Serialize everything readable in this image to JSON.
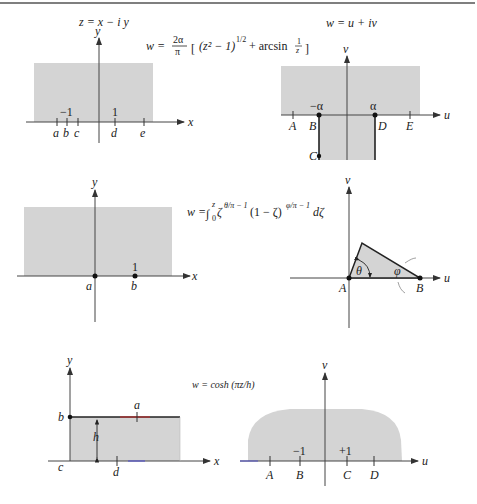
{
  "top_rule": true,
  "panel1": {
    "title": "z = x − i y",
    "axis_y": "y",
    "axis_x": "x",
    "tick_values": {
      "neg_one": "−1",
      "one": "1"
    },
    "points": [
      "a",
      "b",
      "c",
      "d",
      "e"
    ]
  },
  "mapping1": {
    "lhs": "w =",
    "coef_num": "2α",
    "coef_den": "π",
    "body": "(z² − 1)",
    "exponent": "1/2",
    "plus": "+ arcsin",
    "frac_num": "1",
    "frac_den": "z"
  },
  "panel2": {
    "title": "w = u + iv",
    "axis_v": "v",
    "axis_u": "u",
    "tick_values": {
      "neg_alpha": "−α",
      "alpha": "α"
    },
    "points": [
      "A",
      "B",
      "C",
      "D",
      "E"
    ]
  },
  "panel3": {
    "axis_y": "y",
    "axis_x": "x",
    "tick_values": {
      "one": "1"
    },
    "points": [
      "a",
      "b"
    ]
  },
  "mapping2": {
    "lhs": "w =",
    "integral": "∫",
    "upper": "z",
    "lower": "0",
    "zeta1": "ζ",
    "exp1": "θ/π − 1",
    "mid": "(1 − ζ)",
    "exp2": "φ/π − 1",
    "tail": "dζ"
  },
  "panel4": {
    "axis_v": "v",
    "axis_u": "u",
    "angles": {
      "theta": "θ",
      "phi": "φ"
    },
    "points": [
      "A",
      "B"
    ]
  },
  "panel5": {
    "axis_y": "y",
    "axis_x": "x",
    "height_label": "h",
    "points": [
      "a",
      "b",
      "c",
      "d"
    ]
  },
  "mapping3": {
    "formula": "w = cosh (πz/h)"
  },
  "panel6": {
    "axis_v": "v",
    "axis_u": "u",
    "tick_values": {
      "neg_one": "−1",
      "pos_one": "+1"
    },
    "points": [
      "A",
      "B",
      "C",
      "D"
    ]
  }
}
